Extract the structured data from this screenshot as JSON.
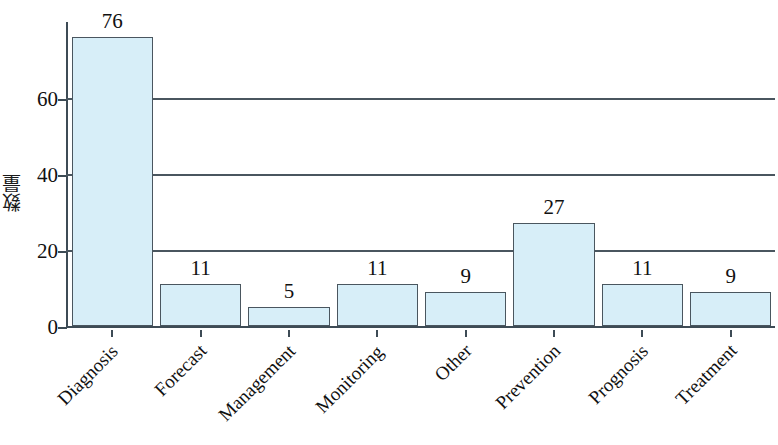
{
  "chart_data": {
    "type": "bar",
    "title": "",
    "xlabel": "",
    "ylabel": "数量",
    "categories": [
      "Diagnosis",
      "Forecast",
      "Management",
      "Monitoring",
      "Other",
      "Prevention",
      "Prognosis",
      "Treatment"
    ],
    "values": [
      76,
      11,
      5,
      11,
      9,
      27,
      11,
      9
    ],
    "value_labels": [
      "76",
      "11",
      "5",
      "11",
      "9",
      "27",
      "11",
      "9"
    ],
    "ylim": [
      0,
      80
    ],
    "yticks": [
      0,
      20,
      40,
      60
    ],
    "ytick_labels": [
      "0",
      "20",
      "40",
      "60"
    ],
    "grid": "horizontal",
    "gridlines_at": [
      20,
      40,
      60
    ],
    "legend": "none",
    "bar_fill_color": "#d7eef8",
    "bar_edge_color": "#4a565f",
    "axis_color": "#3d4b55",
    "background_color": "#ffffff",
    "text_color": "#111111"
  }
}
